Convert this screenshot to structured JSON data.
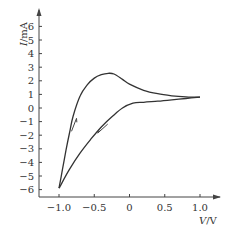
{
  "chart_data": {
    "type": "line",
    "title": "",
    "xlabel": "V/V",
    "ylabel": "I/mA",
    "xlabel_var": "V",
    "xlabel_unit": "/V",
    "ylabel_var": "I",
    "ylabel_unit": "/mA",
    "xlim": [
      -1.25,
      1.3
    ],
    "ylim": [
      -6.5,
      7
    ],
    "grid": false,
    "legend": "none",
    "x_ticks": [
      {
        "value": -1.0,
        "label": "−1.0"
      },
      {
        "value": -0.5,
        "label": "−0.5"
      },
      {
        "value": 0,
        "label": "0"
      },
      {
        "value": 0.5,
        "label": "0.5"
      },
      {
        "value": 1.0,
        "label": "1.0"
      }
    ],
    "y_ticks": [
      {
        "value": 6,
        "label": "6"
      },
      {
        "value": 5,
        "label": "5"
      },
      {
        "value": 4,
        "label": "4"
      },
      {
        "value": 3,
        "label": "3"
      },
      {
        "value": 2,
        "label": "2"
      },
      {
        "value": 1,
        "label": "1"
      },
      {
        "value": 0,
        "label": "0"
      },
      {
        "value": -1,
        "label": "−1"
      },
      {
        "value": -2,
        "label": "−2"
      },
      {
        "value": -3,
        "label": "−3"
      },
      {
        "value": -4,
        "label": "−4"
      },
      {
        "value": -5,
        "label": "−5"
      },
      {
        "value": -6,
        "label": "−6"
      }
    ],
    "series": [
      {
        "name": "forward-sweep",
        "direction": "increasing V",
        "points": [
          [
            -1.0,
            -5.9
          ],
          [
            -0.95,
            -4.5
          ],
          [
            -0.9,
            -3.1
          ],
          [
            -0.85,
            -1.8
          ],
          [
            -0.8,
            -0.6
          ],
          [
            -0.7,
            0.9
          ],
          [
            -0.6,
            1.7
          ],
          [
            -0.5,
            2.2
          ],
          [
            -0.4,
            2.45
          ],
          [
            -0.3,
            2.55
          ],
          [
            -0.22,
            2.5
          ],
          [
            -0.1,
            2.1
          ],
          [
            0.0,
            1.75
          ],
          [
            0.2,
            1.3
          ],
          [
            0.4,
            1.05
          ],
          [
            0.6,
            0.9
          ],
          [
            0.8,
            0.82
          ],
          [
            1.0,
            0.8
          ]
        ]
      },
      {
        "name": "reverse-sweep",
        "direction": "decreasing V",
        "points": [
          [
            1.0,
            0.8
          ],
          [
            0.8,
            0.7
          ],
          [
            0.6,
            0.6
          ],
          [
            0.4,
            0.5
          ],
          [
            0.2,
            0.42
          ],
          [
            0.05,
            0.35
          ],
          [
            -0.1,
            0.0
          ],
          [
            -0.25,
            -0.65
          ],
          [
            -0.4,
            -1.4
          ],
          [
            -0.55,
            -2.3
          ],
          [
            -0.7,
            -3.3
          ],
          [
            -0.85,
            -4.5
          ],
          [
            -1.0,
            -5.9
          ]
        ]
      }
    ],
    "annotations": [
      {
        "type": "arrow",
        "meaning": "forward sweep direction (upward)",
        "at": [
          -0.78,
          -1.2
        ],
        "direction": "up-right"
      },
      {
        "type": "arrow",
        "meaning": "reverse sweep direction (downward)",
        "at": [
          -0.38,
          -1.55
        ],
        "direction": "down-left"
      }
    ]
  }
}
